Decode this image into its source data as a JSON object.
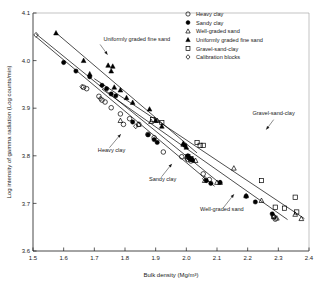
{
  "chart_data": {
    "type": "scatter",
    "title": "",
    "xlabel": "Bulk density (Mg/m³)",
    "ylabel": "Log intensity of gamma radiation (Log counts/min)",
    "xlim": [
      1.5,
      2.4
    ],
    "ylim": [
      3.6,
      4.1
    ],
    "xticks": [
      "1.5",
      "1.6",
      "1.7",
      "1.8",
      "1.9",
      "2.0",
      "2.1",
      "2.2",
      "2.3",
      "2.4"
    ],
    "xtick_values": [
      1.5,
      1.6,
      1.7,
      1.8,
      1.9,
      2.0,
      2.1,
      2.2,
      2.3,
      2.4
    ],
    "yticks": [
      "3.6",
      "3.7",
      "3.8",
      "3.9",
      "4.0",
      "4.1"
    ],
    "ytick_values": [
      3.6,
      3.7,
      3.8,
      3.9,
      4.0,
      4.1
    ],
    "grid": false,
    "legend_position": "top-right",
    "series": [
      {
        "name": "Heavy clay",
        "marker": "open-circle",
        "color": "#000000",
        "points": [
          [
            1.665,
            3.944
          ],
          [
            1.675,
            3.941
          ],
          [
            1.715,
            3.925
          ],
          [
            1.725,
            3.917
          ],
          [
            1.735,
            3.913
          ],
          [
            1.755,
            3.901
          ],
          [
            1.785,
            3.888
          ],
          [
            1.795,
            3.866
          ],
          [
            1.815,
            3.878
          ],
          [
            1.845,
            3.866
          ],
          [
            1.875,
            3.845
          ],
          [
            1.895,
            3.838
          ],
          [
            1.925,
            3.808
          ],
          [
            1.985,
            3.798
          ],
          [
            2.005,
            3.792
          ],
          [
            2.015,
            3.789
          ],
          [
            2.055,
            3.762
          ],
          [
            2.075,
            3.75
          ],
          [
            2.285,
            3.672
          ],
          [
            2.29,
            3.667
          ]
        ]
      },
      {
        "name": "Sandy clay",
        "marker": "filled-circle",
        "color": "#000000",
        "points": [
          [
            1.6,
            3.996
          ],
          [
            1.64,
            3.978
          ],
          [
            1.685,
            3.966
          ],
          [
            1.725,
            3.948
          ],
          [
            1.74,
            3.941
          ],
          [
            1.755,
            3.93
          ],
          [
            1.77,
            3.926
          ],
          [
            1.825,
            3.871
          ],
          [
            1.875,
            3.844
          ],
          [
            1.895,
            3.834
          ],
          [
            1.905,
            3.828
          ],
          [
            1.995,
            3.822
          ],
          [
            2.005,
            3.8
          ],
          [
            2.01,
            3.795
          ],
          [
            2.015,
            3.793
          ],
          [
            2.02,
            3.791
          ],
          [
            2.065,
            3.748
          ],
          [
            2.08,
            3.742
          ],
          [
            2.11,
            3.744
          ],
          [
            2.195,
            3.715
          ],
          [
            2.225,
            3.703
          ],
          [
            2.28,
            3.678
          ]
        ]
      },
      {
        "name": "Well-graded sand",
        "marker": "open-triangle",
        "color": "#000000",
        "points": [
          [
            1.785,
            3.874
          ],
          [
            1.845,
            3.866
          ],
          [
            1.885,
            3.872
          ],
          [
            1.905,
            3.874
          ],
          [
            1.99,
            3.824
          ],
          [
            2.005,
            3.799
          ],
          [
            2.02,
            3.792
          ],
          [
            2.03,
            3.79
          ],
          [
            2.06,
            3.748
          ],
          [
            2.1,
            3.744
          ],
          [
            2.11,
            3.744
          ],
          [
            2.155,
            3.774
          ],
          [
            2.195,
            3.716
          ],
          [
            2.245,
            3.706
          ],
          [
            2.285,
            3.672
          ],
          [
            2.295,
            3.669
          ],
          [
            2.355,
            3.677
          ],
          [
            2.375,
            3.668
          ]
        ]
      },
      {
        "name": "Uniformly graded fine sand",
        "marker": "filled-triangle",
        "color": "#000000",
        "points": [
          [
            1.575,
            4.058
          ],
          [
            1.665,
            4.0
          ],
          [
            1.685,
            3.972
          ],
          [
            1.745,
            3.99
          ],
          [
            1.755,
            3.978
          ],
          [
            1.76,
            3.988
          ],
          [
            1.765,
            3.944
          ],
          [
            1.785,
            3.938
          ],
          [
            1.805,
            3.922
          ],
          [
            1.825,
            3.912
          ],
          [
            1.88,
            3.898
          ],
          [
            1.9,
            3.874
          ],
          [
            1.92,
            3.862
          ],
          [
            1.99,
            3.826
          ],
          [
            2.0,
            3.818
          ]
        ]
      },
      {
        "name": "Gravel-sand-clay",
        "marker": "open-square",
        "color": "#000000",
        "points": [
          [
            1.89,
            3.876
          ],
          [
            1.92,
            3.87
          ],
          [
            2.005,
            3.798
          ],
          [
            2.015,
            3.794
          ],
          [
            2.035,
            3.828
          ],
          [
            2.045,
            3.822
          ],
          [
            2.055,
            3.822
          ],
          [
            2.245,
            3.748
          ],
          [
            2.29,
            3.692
          ],
          [
            2.32,
            3.69
          ],
          [
            2.355,
            3.713
          ],
          [
            2.36,
            3.682
          ]
        ]
      },
      {
        "name": "Calibration blocks",
        "marker": "open-diamond",
        "color": "#000000",
        "points": [
          [
            1.51,
            4.054
          ],
          [
            1.66,
            3.945
          ],
          [
            1.72,
            3.92
          ],
          [
            1.835,
            3.862
          ],
          [
            2.0,
            3.795
          ],
          [
            2.06,
            3.752
          ],
          [
            2.285,
            3.673
          ]
        ]
      }
    ],
    "trend_lines": [
      {
        "name": "Uniformly graded fine sand",
        "x": [
          1.572,
          2.035
        ],
        "y": [
          4.06,
          3.806
        ]
      },
      {
        "name": "Gravel-sand-clay",
        "x": [
          1.7,
          2.385
        ],
        "y": [
          3.962,
          3.668
        ]
      },
      {
        "name": "Heavy clay",
        "x": [
          1.51,
          2.11
        ],
        "y": [
          4.056,
          3.742
        ]
      },
      {
        "name": "Sandy clay",
        "x": [
          1.51,
          2.092
        ],
        "y": [
          4.05,
          3.736
        ]
      },
      {
        "name": "Well-graded sand",
        "x": [
          1.725,
          2.33
        ],
        "y": [
          3.94,
          3.666
        ]
      }
    ],
    "annotations": [
      {
        "label": "Uniformly graded fine sand",
        "text_x": 0.255,
        "text_y": 0.118,
        "anchor": "start",
        "line": [
          [
            0.243,
            0.132
          ],
          [
            0.27,
            0.175
          ]
        ]
      },
      {
        "label": "Gravel-sand-clay",
        "text_x": 0.795,
        "text_y": 0.43,
        "anchor": "start",
        "line": [
          [
            0.872,
            0.448
          ],
          [
            0.845,
            0.49
          ]
        ]
      },
      {
        "label": "Heavy clay",
        "text_x": 0.235,
        "text_y": 0.582,
        "anchor": "start",
        "line": [
          [
            0.277,
            0.566
          ],
          [
            0.318,
            0.509
          ]
        ]
      },
      {
        "label": "Sandy clay",
        "text_x": 0.42,
        "text_y": 0.704,
        "anchor": "start",
        "line": [
          [
            0.466,
            0.688
          ],
          [
            0.503,
            0.634
          ]
        ]
      },
      {
        "label": "Well-graded sand",
        "text_x": 0.605,
        "text_y": 0.832,
        "anchor": "start",
        "line": [
          [
            0.69,
            0.818
          ],
          [
            0.728,
            0.762
          ]
        ]
      }
    ],
    "legend": [
      {
        "label": "Heavy clay",
        "marker": "open-circle"
      },
      {
        "label": "Sandy clay",
        "marker": "filled-circle"
      },
      {
        "label": "Well-graded sand",
        "marker": "open-triangle"
      },
      {
        "label": "Uniformly graded fine sand",
        "marker": "filled-triangle"
      },
      {
        "label": "Gravel-sand-clay",
        "marker": "open-square"
      },
      {
        "label": "Calibration blocks",
        "marker": "open-diamond"
      }
    ]
  }
}
